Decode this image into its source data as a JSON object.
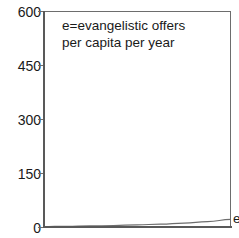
{
  "chart_data": {
    "type": "line",
    "title": "",
    "subtitle": "",
    "xlabel": "",
    "ylabel": "",
    "annotation_lines": [
      "e=evangelistic offers",
      "per capita per year"
    ],
    "ylim": [
      0,
      600
    ],
    "yticks": [
      600,
      450,
      300,
      150,
      0
    ],
    "ytick_labels": [
      "600",
      "450",
      "300",
      "150",
      "0"
    ],
    "grid": false,
    "legend_position": "none",
    "series": [
      {
        "name": "e",
        "label": "e",
        "color": "#6d6d6d",
        "x": [
          0,
          0.125,
          0.25,
          0.375,
          0.5,
          0.625,
          0.75,
          0.875,
          1
        ],
        "values": [
          1,
          2,
          3,
          4,
          6,
          8,
          11,
          15,
          21
        ]
      }
    ]
  },
  "axis": {
    "tick_600": "600",
    "tick_450": "450",
    "tick_300": "300",
    "tick_150": "150",
    "tick_0": "0"
  },
  "annotation": {
    "line1": "e=evangelistic offers",
    "line2": "per capita per year"
  },
  "series_label": {
    "text": "e"
  },
  "colors": {
    "axis": "#595959",
    "frame": "#6d6d6d",
    "curve": "#6d6d6d",
    "text": "#1a1a1a",
    "background": "#ffffff"
  }
}
